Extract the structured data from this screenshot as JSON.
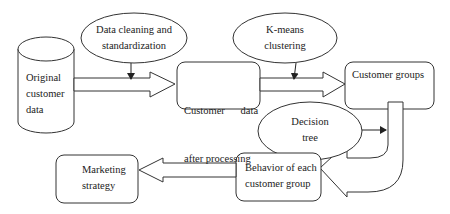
{
  "diagram": {
    "nodes": {
      "original": {
        "label_lines": [
          "Original",
          "customer",
          "data"
        ],
        "shape": "cylinder"
      },
      "cleaning": {
        "label_lines": [
          "Data cleaning and",
          "standardization"
        ],
        "shape": "ellipse"
      },
      "processed": {
        "label_lines": [
          "Customer      data",
          "after processing"
        ],
        "shape": "rounded-rect"
      },
      "kmeans": {
        "label_lines": [
          "K-means",
          "clustering"
        ],
        "shape": "ellipse"
      },
      "groups": {
        "label_lines": [
          "Customer groups"
        ],
        "shape": "rounded-rect"
      },
      "decision": {
        "label_lines": [
          "Decision",
          "tree"
        ],
        "shape": "ellipse"
      },
      "behavior": {
        "label_lines": [
          "Behavior of each",
          "customer group"
        ],
        "shape": "rounded-rect"
      },
      "marketing": {
        "label_lines": [
          "Marketing",
          "strategy"
        ],
        "shape": "rounded-rect"
      }
    },
    "edges": [
      {
        "from": "original",
        "to": "processed",
        "type": "block-arrow"
      },
      {
        "from": "cleaning",
        "to": "original->processed",
        "type": "line-arrow"
      },
      {
        "from": "processed",
        "to": "groups",
        "type": "block-arrow"
      },
      {
        "from": "kmeans",
        "to": "processed->groups",
        "type": "line-arrow"
      },
      {
        "from": "groups",
        "to": "behavior",
        "type": "u-turn-block-arrow"
      },
      {
        "from": "decision",
        "to": "groups->behavior",
        "type": "line-arrow"
      },
      {
        "from": "behavior",
        "to": "marketing",
        "type": "block-arrow"
      }
    ],
    "colors": {
      "stroke": "#333333",
      "fill": "#ffffff",
      "text": "#222222"
    }
  }
}
